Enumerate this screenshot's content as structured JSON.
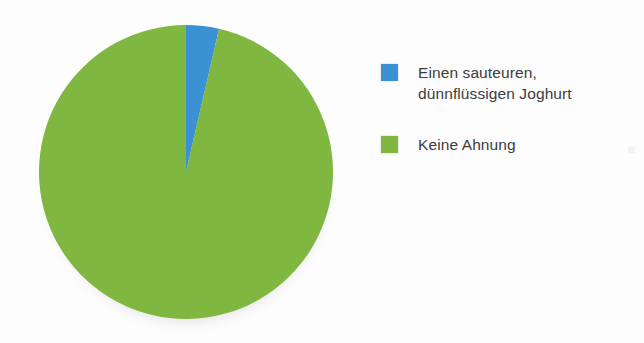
{
  "chart_data": {
    "type": "pie",
    "title": "",
    "subtitle": "",
    "xlabel": "",
    "ylabel": "",
    "grid": false,
    "legend_position": "right",
    "start_angle_deg": 0,
    "direction": "clockwise",
    "categories": [
      "Einen sauteuren, dünnflüssigen Joghurt",
      "Keine Ahnung"
    ],
    "values": [
      3.6,
      96.4
    ],
    "colors": [
      "#3a92d4",
      "#7fb740"
    ],
    "slices": [
      {
        "label": "Einen sauteuren,\ndünnflüssigen Joghurt",
        "value": 3.6,
        "color": "#3a92d4",
        "start_deg": 0,
        "end_deg": 13
      },
      {
        "label": "Keine Ahnung",
        "value": 96.4,
        "color": "#7fb740",
        "start_deg": 13,
        "end_deg": 360
      }
    ]
  },
  "legend": {
    "items": [
      {
        "label": "Einen sauteuren,\ndünnflüssigen Joghurt",
        "color": "#3a92d4",
        "swatch_name": "legend-swatch-blue"
      },
      {
        "label": "Keine Ahnung",
        "color": "#7fb740",
        "swatch_name": "legend-swatch-green"
      }
    ]
  },
  "colors": {
    "background": "#fdfdfd",
    "blue": "#3a92d4",
    "green": "#7fb740",
    "text": "#3c3c3c"
  }
}
